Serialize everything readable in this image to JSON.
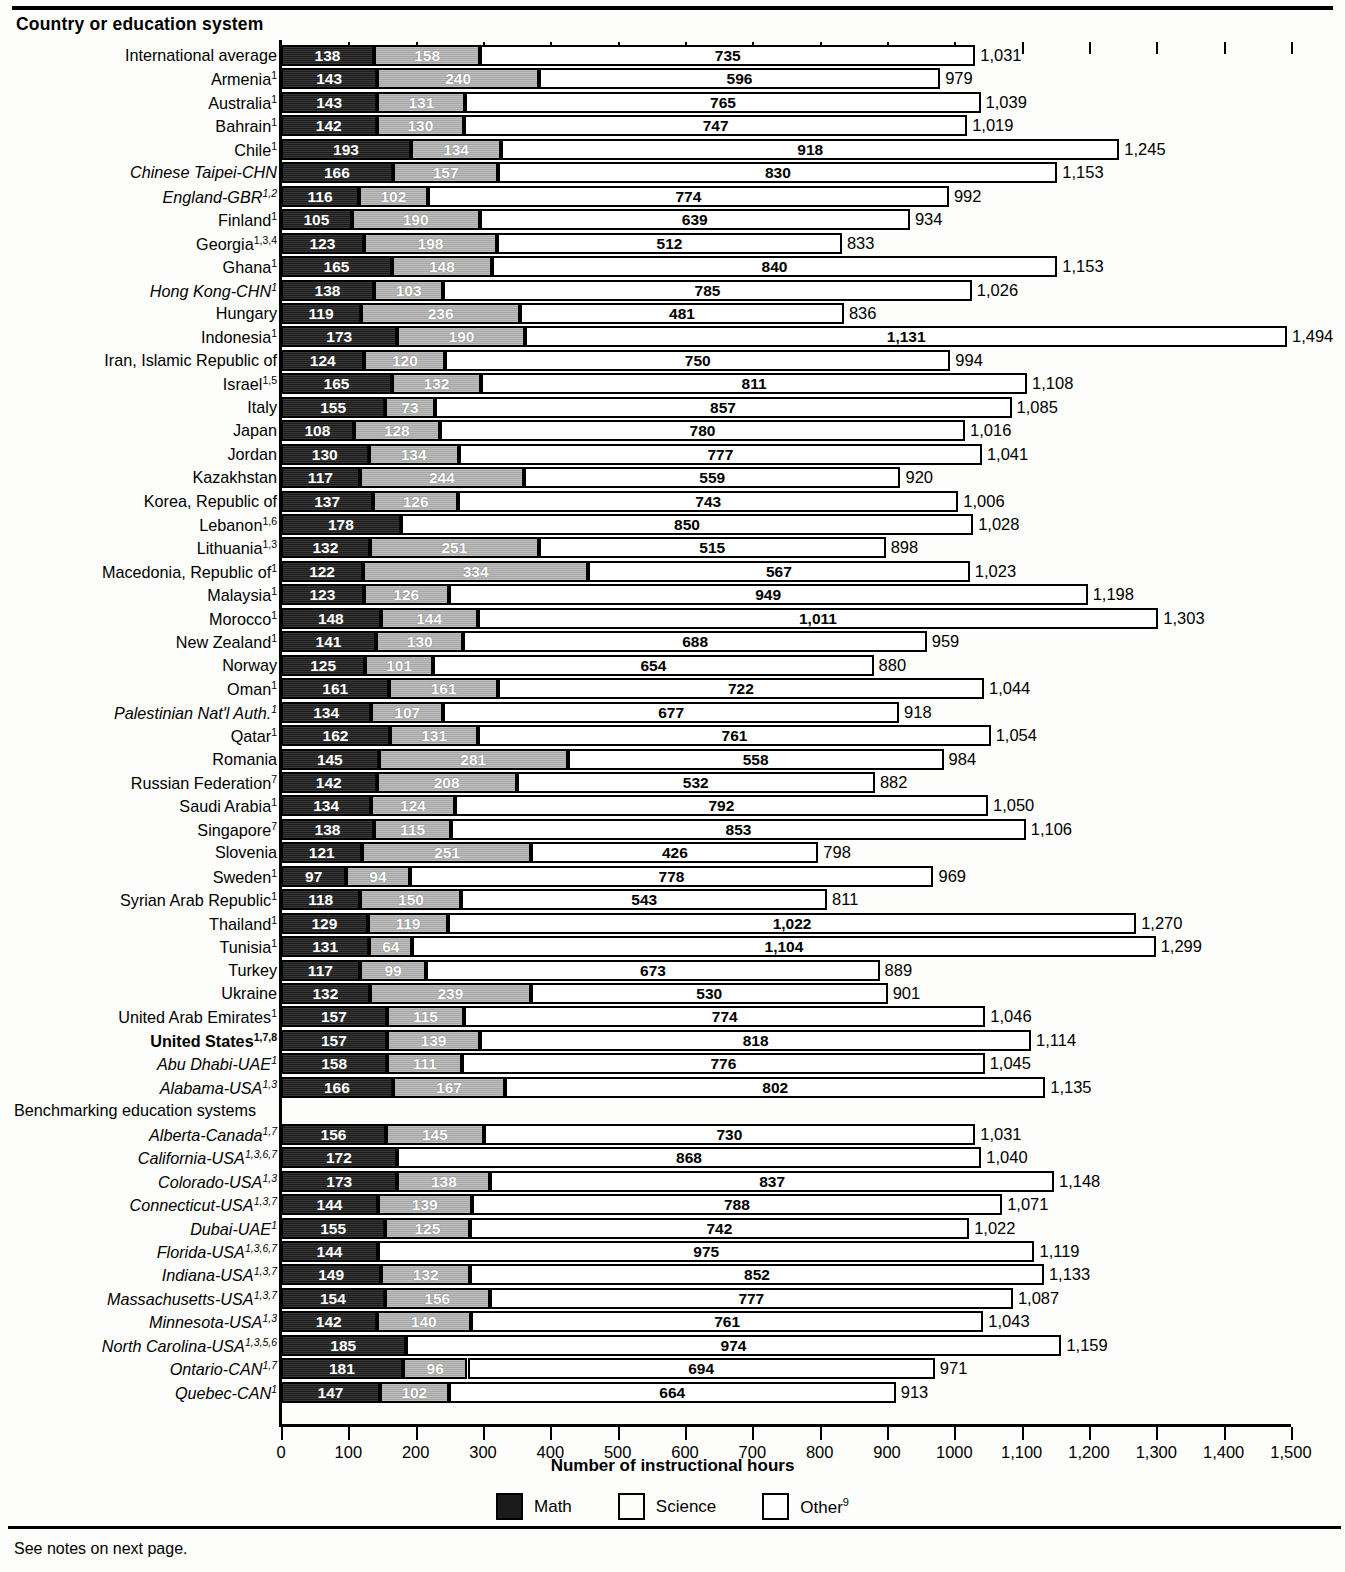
{
  "header": {
    "column_header": "Country or education system",
    "footer_note": "See notes on next page."
  },
  "chart_data": {
    "type": "bar",
    "subtype": "stacked-horizontal",
    "title": "",
    "xlabel": "Number of instructional hours",
    "ylabel": "Country or education system",
    "xlim": [
      0,
      1500
    ],
    "xticks": [
      0,
      100,
      200,
      300,
      400,
      500,
      600,
      700,
      800,
      900,
      1000,
      1100,
      1200,
      1300,
      1400,
      1500
    ],
    "xticklabels": [
      "0",
      "100",
      "200",
      "300",
      "400",
      "500",
      "600",
      "700",
      "800",
      "900",
      "1000",
      "1,100",
      "1,200",
      "1,300",
      "1,400",
      "1,500"
    ],
    "grid": false,
    "legend": {
      "position": "bottom",
      "entries": [
        {
          "name": "Math",
          "label": "Math",
          "color": "#1b1b1b"
        },
        {
          "name": "Science",
          "label": "Science",
          "color": "#a6a6a6"
        },
        {
          "name": "Other",
          "label": "Other",
          "sup": "9",
          "color": "#ffffff"
        }
      ]
    },
    "series": [
      "Math",
      "Science",
      "Other"
    ],
    "group_headings": [
      {
        "after_index": 44,
        "label": "Benchmarking education systems"
      }
    ],
    "categories": [
      {
        "label": "International average",
        "sup": "",
        "style": "plain",
        "math": 138,
        "science": 158,
        "other": 735,
        "total": "1,031"
      },
      {
        "label": "Armenia",
        "sup": "1",
        "style": "plain",
        "math": 143,
        "science": 240,
        "other": 596,
        "total": "979"
      },
      {
        "label": "Australia",
        "sup": "1",
        "style": "plain",
        "math": 143,
        "science": 131,
        "other": 765,
        "total": "1,039"
      },
      {
        "label": "Bahrain",
        "sup": "1",
        "style": "plain",
        "math": 142,
        "science": 130,
        "other": 747,
        "total": "1,019"
      },
      {
        "label": "Chile",
        "sup": "1",
        "style": "plain",
        "math": 193,
        "science": 134,
        "other": 918,
        "total": "1,245"
      },
      {
        "label": "Chinese Taipei-CHN",
        "sup": "",
        "style": "italic",
        "math": 166,
        "science": 157,
        "other": 830,
        "total": "1,153"
      },
      {
        "label": "England-GBR",
        "sup": "1,2",
        "style": "italic",
        "math": 116,
        "science": 102,
        "other": 774,
        "total": "992"
      },
      {
        "label": "Finland",
        "sup": "1",
        "style": "plain",
        "math": 105,
        "science": 190,
        "other": 639,
        "total": "934"
      },
      {
        "label": "Georgia",
        "sup": "1,3,4",
        "style": "plain",
        "math": 123,
        "science": 198,
        "other": 512,
        "total": "833"
      },
      {
        "label": "Ghana",
        "sup": "1",
        "style": "plain",
        "math": 165,
        "science": 148,
        "other": 840,
        "total": "1,153"
      },
      {
        "label": "Hong Kong-CHN",
        "sup": "1",
        "style": "italic",
        "math": 138,
        "science": 103,
        "other": 785,
        "total": "1,026"
      },
      {
        "label": "Hungary",
        "sup": "",
        "style": "plain",
        "math": 119,
        "science": 236,
        "other": 481,
        "total": "836"
      },
      {
        "label": "Indonesia",
        "sup": "1",
        "style": "plain",
        "math": 173,
        "science": 190,
        "other": 1131,
        "total": "1,494",
        "other_label": "1,131"
      },
      {
        "label": "Iran, Islamic Republic of",
        "sup": "",
        "style": "plain",
        "math": 124,
        "science": 120,
        "other": 750,
        "total": "994"
      },
      {
        "label": "Israel",
        "sup": "1,5",
        "style": "plain",
        "math": 165,
        "science": 132,
        "other": 811,
        "total": "1,108"
      },
      {
        "label": "Italy",
        "sup": "",
        "style": "plain",
        "math": 155,
        "science": 73,
        "other": 857,
        "total": "1,085"
      },
      {
        "label": "Japan",
        "sup": "",
        "style": "plain",
        "math": 108,
        "science": 128,
        "other": 780,
        "total": "1,016"
      },
      {
        "label": "Jordan",
        "sup": "",
        "style": "plain",
        "math": 130,
        "science": 134,
        "other": 777,
        "total": "1,041"
      },
      {
        "label": "Kazakhstan",
        "sup": "",
        "style": "plain",
        "math": 117,
        "science": 244,
        "other": 559,
        "total": "920"
      },
      {
        "label": "Korea, Republic of",
        "sup": "",
        "style": "plain",
        "math": 137,
        "science": 126,
        "other": 743,
        "total": "1,006"
      },
      {
        "label": "Lebanon",
        "sup": "1,6",
        "style": "plain",
        "math": 178,
        "science": 0,
        "other": 850,
        "total": "1,028"
      },
      {
        "label": "Lithuania",
        "sup": "1,3",
        "style": "plain",
        "math": 132,
        "science": 251,
        "other": 515,
        "total": "898"
      },
      {
        "label": "Macedonia, Republic of",
        "sup": "1",
        "style": "plain",
        "math": 122,
        "science": 334,
        "other": 567,
        "total": "1,023"
      },
      {
        "label": "Malaysia",
        "sup": "1",
        "style": "plain",
        "math": 123,
        "science": 126,
        "other": 949,
        "total": "1,198"
      },
      {
        "label": "Morocco",
        "sup": "1",
        "style": "plain",
        "math": 148,
        "science": 144,
        "other": 1011,
        "total": "1,303",
        "other_label": "1,011"
      },
      {
        "label": "New Zealand",
        "sup": "1",
        "style": "plain",
        "math": 141,
        "science": 130,
        "other": 688,
        "total": "959"
      },
      {
        "label": "Norway",
        "sup": "",
        "style": "plain",
        "math": 125,
        "science": 101,
        "other": 654,
        "total": "880"
      },
      {
        "label": "Oman",
        "sup": "1",
        "style": "plain",
        "math": 161,
        "science": 161,
        "other": 722,
        "total": "1,044"
      },
      {
        "label": "Palestinian Nat'l  Auth.",
        "sup": "1",
        "style": "italic",
        "math": 134,
        "science": 107,
        "other": 677,
        "total": "918"
      },
      {
        "label": "Qatar",
        "sup": "1",
        "style": "plain",
        "math": 162,
        "science": 131,
        "other": 761,
        "total": "1,054"
      },
      {
        "label": "Romania",
        "sup": "",
        "style": "plain",
        "math": 145,
        "science": 281,
        "other": 558,
        "total": "984"
      },
      {
        "label": "Russian Federation",
        "sup": "7",
        "style": "plain",
        "math": 142,
        "science": 208,
        "other": 532,
        "total": "882"
      },
      {
        "label": "Saudi Arabia",
        "sup": "1",
        "style": "plain",
        "math": 134,
        "science": 124,
        "other": 792,
        "total": "1,050"
      },
      {
        "label": "Singapore",
        "sup": "7",
        "style": "plain",
        "math": 138,
        "science": 115,
        "other": 853,
        "total": "1,106"
      },
      {
        "label": "Slovenia",
        "sup": "",
        "style": "plain",
        "math": 121,
        "science": 251,
        "other": 426,
        "total": "798"
      },
      {
        "label": "Sweden",
        "sup": "1",
        "style": "plain",
        "math": 97,
        "science": 94,
        "other": 778,
        "total": "969"
      },
      {
        "label": "Syrian Arab Republic",
        "sup": "1",
        "style": "plain",
        "math": 118,
        "science": 150,
        "other": 543,
        "total": "811"
      },
      {
        "label": "Thailand",
        "sup": "1",
        "style": "plain",
        "math": 129,
        "science": 119,
        "other": 1022,
        "total": "1,270",
        "other_label": "1,022"
      },
      {
        "label": "Tunisia",
        "sup": "1",
        "style": "plain",
        "math": 131,
        "science": 64,
        "other": 1104,
        "total": "1,299",
        "other_label": "1,104"
      },
      {
        "label": "Turkey",
        "sup": "",
        "style": "plain",
        "math": 117,
        "science": 99,
        "other": 673,
        "total": "889"
      },
      {
        "label": "Ukraine",
        "sup": "",
        "style": "plain",
        "math": 132,
        "science": 239,
        "other": 530,
        "total": "901"
      },
      {
        "label": "United Arab Emirates",
        "sup": "1",
        "style": "plain",
        "math": 157,
        "science": 115,
        "other": 774,
        "total": "1,046"
      },
      {
        "label": "United States",
        "sup": "1,7,8",
        "style": "bold",
        "math": 157,
        "science": 139,
        "other": 818,
        "total": "1,114"
      },
      {
        "label": "Abu Dhabi-UAE",
        "sup": "1",
        "style": "italic",
        "math": 158,
        "science": 111,
        "other": 776,
        "total": "1,045"
      },
      {
        "label": "Alabama-USA",
        "sup": "1,3",
        "style": "italic",
        "math": 166,
        "science": 167,
        "other": 802,
        "total": "1,135"
      },
      {
        "label": "Alberta-Canada",
        "sup": "1,7",
        "style": "italic",
        "math": 156,
        "science": 145,
        "other": 730,
        "total": "1,031"
      },
      {
        "label": "California-USA",
        "sup": "1,3,6,7",
        "style": "italic",
        "math": 172,
        "science": 0,
        "other": 868,
        "total": "1,040"
      },
      {
        "label": "Colorado-USA",
        "sup": "1,3",
        "style": "italic",
        "math": 173,
        "science": 138,
        "other": 837,
        "total": "1,148"
      },
      {
        "label": "Connecticut-USA",
        "sup": "1,3,7",
        "style": "italic",
        "math": 144,
        "science": 139,
        "other": 788,
        "total": "1,071"
      },
      {
        "label": "Dubai-UAE",
        "sup": "1",
        "style": "italic",
        "math": 155,
        "science": 125,
        "other": 742,
        "total": "1,022"
      },
      {
        "label": "Florida-USA",
        "sup": "1,3,6,7",
        "style": "italic",
        "math": 144,
        "science": 0,
        "other": 975,
        "total": "1,119"
      },
      {
        "label": "Indiana-USA",
        "sup": "1,3,7",
        "style": "italic",
        "math": 149,
        "science": 132,
        "other": 852,
        "total": "1,133"
      },
      {
        "label": "Massachusetts-USA",
        "sup": "1,3,7",
        "style": "italic",
        "math": 154,
        "science": 156,
        "other": 777,
        "total": "1,087"
      },
      {
        "label": "Minnesota-USA",
        "sup": "1,3",
        "style": "italic",
        "math": 142,
        "science": 140,
        "other": 761,
        "total": "1,043"
      },
      {
        "label": "North Carolina-USA",
        "sup": "1,3,5,6",
        "style": "italic",
        "math": 185,
        "science": 0,
        "other": 974,
        "total": "1,159"
      },
      {
        "label": "Ontario-CAN",
        "sup": "1,7",
        "style": "italic",
        "math": 181,
        "science": 96,
        "other": 694,
        "total": "971"
      },
      {
        "label": "Quebec-CAN",
        "sup": "1",
        "style": "italic",
        "math": 147,
        "science": 102,
        "other": 664,
        "total": "913"
      }
    ]
  }
}
